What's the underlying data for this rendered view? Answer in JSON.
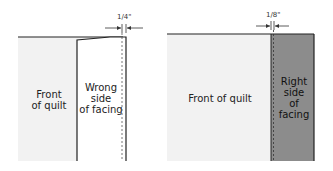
{
  "left_diagram": {
    "dimension": "1/4\"",
    "quilt_label": [
      "Front",
      "of quilt"
    ],
    "facing_label": [
      "Wrong",
      "side",
      "of facing"
    ]
  },
  "right_diagram": {
    "dimension": "1/8\"",
    "quilt_label": [
      "Front of quilt"
    ],
    "facing_label": [
      "Right",
      "side",
      "of",
      "facing"
    ]
  },
  "colors": {
    "quilt_fill": "#f2f2f2",
    "facing_light": "#ffffff",
    "facing_dark": "#8c8c8c",
    "line": "#222222"
  }
}
